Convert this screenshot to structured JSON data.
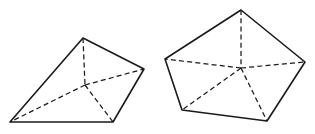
{
  "document": {
    "title": "Geometric Figures",
    "background_color": "#ffffff",
    "width": 315,
    "height": 134,
    "description": "Two line-drawn polyhedra shown in perspective, each a pyramid with hidden interior edges drawn dashed"
  },
  "style": {
    "solid_stroke_color": "#1a1a1a",
    "hidden_stroke_color": "#1a1a1a",
    "solid_stroke_width": 1.6,
    "hidden_stroke_width": 1.25,
    "hidden_dash_pattern": "5 3.2",
    "face_fill": "#ffffff"
  },
  "figures": [
    {
      "id": "left-figure",
      "name": "quadrilateral-pyramid",
      "label": "",
      "base_sides": 4,
      "apex": {
        "x": 83,
        "y": 38
      },
      "interior_point": {
        "x": 85,
        "y": 85
      },
      "outline_points": "10,122 83,38 144,69 113,122",
      "vertices": [
        {
          "name": "bottom-left",
          "x": 10,
          "y": 122
        },
        {
          "name": "apex-top",
          "x": 83,
          "y": 38
        },
        {
          "name": "right",
          "x": 144,
          "y": 69
        },
        {
          "name": "bottom-right",
          "x": 113,
          "y": 122
        }
      ],
      "hidden_edges": [
        {
          "name": "apex-to-center",
          "x1": 83,
          "y1": 38,
          "x2": 85,
          "y2": 85
        },
        {
          "name": "center-to-bottom-left",
          "x1": 85,
          "y1": 85,
          "x2": 10,
          "y2": 122
        },
        {
          "name": "center-to-right",
          "x1": 85,
          "y1": 85,
          "x2": 144,
          "y2": 69
        },
        {
          "name": "center-to-bottom-right",
          "x1": 85,
          "y1": 85,
          "x2": 113,
          "y2": 122
        }
      ]
    },
    {
      "id": "right-figure",
      "name": "pentagonal-pyramid",
      "label": "",
      "base_sides": 5,
      "apex": {
        "x": 241,
        "y": 10
      },
      "interior_point": {
        "x": 241,
        "y": 68
      },
      "outline_points": "241,10 305,62 267,121 182,110 165,59",
      "vertices": [
        {
          "name": "apex-top",
          "x": 241,
          "y": 10
        },
        {
          "name": "right",
          "x": 305,
          "y": 62
        },
        {
          "name": "bottom-right",
          "x": 267,
          "y": 121
        },
        {
          "name": "bottom-left",
          "x": 182,
          "y": 110
        },
        {
          "name": "left",
          "x": 165,
          "y": 59
        }
      ],
      "hidden_edges": [
        {
          "name": "apex-to-center",
          "x1": 241,
          "y1": 10,
          "x2": 241,
          "y2": 68
        },
        {
          "name": "center-to-left",
          "x1": 241,
          "y1": 68,
          "x2": 165,
          "y2": 59
        },
        {
          "name": "center-to-right",
          "x1": 241,
          "y1": 68,
          "x2": 305,
          "y2": 62
        },
        {
          "name": "center-to-bottom-left",
          "x1": 241,
          "y1": 68,
          "x2": 182,
          "y2": 110
        },
        {
          "name": "center-to-bottom-right",
          "x1": 241,
          "y1": 68,
          "x2": 267,
          "y2": 121
        }
      ]
    }
  ]
}
